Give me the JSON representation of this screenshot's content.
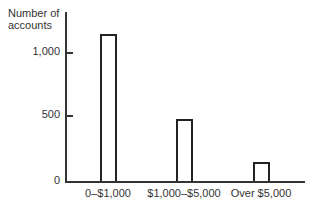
{
  "chart_data": {
    "type": "bar",
    "title": "",
    "xlabel": "",
    "ylabel": "Number of accounts",
    "ylabel_lines": [
      "Number of",
      "accounts"
    ],
    "categories": [
      "0–$1,000",
      "$1,000–$5,000",
      "Over $5,000"
    ],
    "values": [
      1140,
      480,
      150
    ],
    "yticks": [
      0,
      500,
      1000
    ],
    "ytick_labels": [
      "0",
      "500",
      "1,000"
    ],
    "ylim": [
      0,
      1250
    ],
    "grid": false,
    "legend": null,
    "bar_fill": "#ffffff",
    "bar_stroke": "#222222"
  }
}
